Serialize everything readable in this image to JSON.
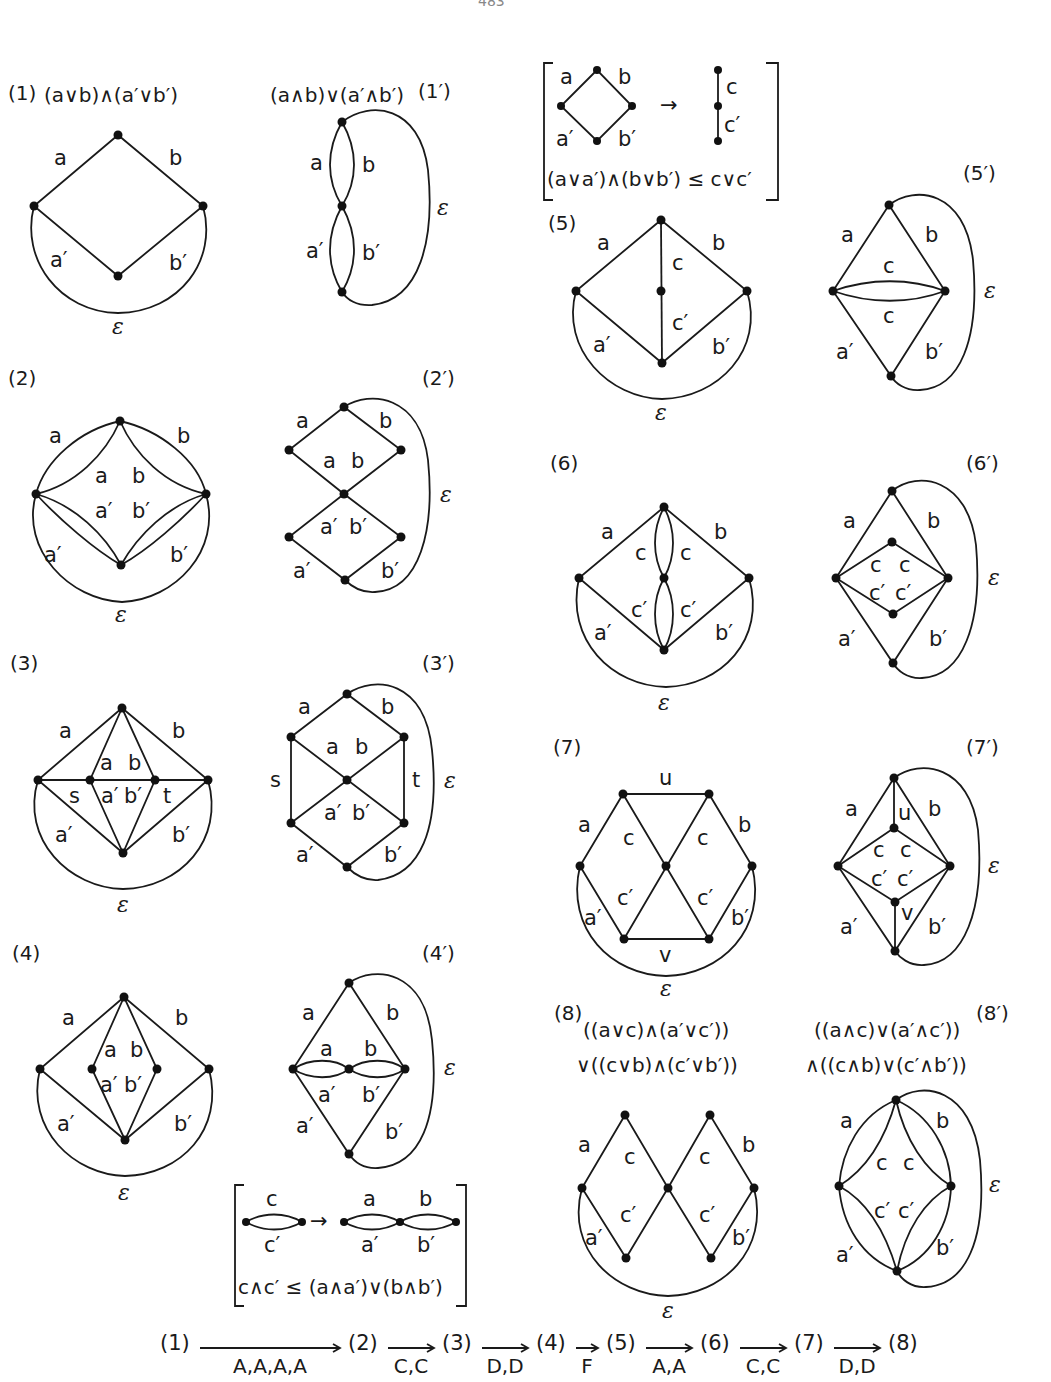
{
  "page_number": "483",
  "figures": {
    "f1": {
      "tag": "(1)",
      "formula": "(a∨b)∧(a′∨b′)"
    },
    "f1p": {
      "tag": "(1′)",
      "formula": "(a∧b)∨(a′∧b′)"
    },
    "f2": {
      "tag": "(2)"
    },
    "f2p": {
      "tag": "(2′)"
    },
    "f3": {
      "tag": "(3)"
    },
    "f3p": {
      "tag": "(3′)"
    },
    "f4": {
      "tag": "(4)"
    },
    "f4p": {
      "tag": "(4′)"
    },
    "f5": {
      "tag": "(5)"
    },
    "f5p": {
      "tag": "(5′)"
    },
    "f6": {
      "tag": "(6)"
    },
    "f6p": {
      "tag": "(6′)"
    },
    "f7": {
      "tag": "(7)"
    },
    "f7p": {
      "tag": "(7′)"
    },
    "f8": {
      "tag": "(8)",
      "formula_line1": "((a∨c)∧(a′∨c′))",
      "formula_line2": "∨((c∨b)∧(c′∨b′))"
    },
    "f8p": {
      "tag": "(8′)",
      "formula_line1": "((a∧c)∨(a′∧c′))",
      "formula_line2": "∧((c∧b)∨(c′∧b′))"
    }
  },
  "labels": {
    "a": "a",
    "b": "b",
    "ap": "a′",
    "bp": "b′",
    "c": "c",
    "cp": "c′",
    "s": "s",
    "t": "t",
    "u": "u",
    "v": "v",
    "eps": "ε",
    "arrow": "→"
  },
  "rule_top": {
    "inequality": "(a∨a′)∧(b∨b′) ≤ c∨c′"
  },
  "rule_bottom": {
    "inequality": "c∧c′ ≤ (a∧a′)∨(b∧b′)"
  },
  "sequence": {
    "steps": [
      "(1)",
      "(2)",
      "(3)",
      "(4)",
      "(5)",
      "(6)",
      "(7)",
      "(8)"
    ],
    "moves": [
      "A,A,A,A",
      "C,C",
      "D,D",
      "F",
      "A,A",
      "C,C",
      "D,D"
    ]
  }
}
